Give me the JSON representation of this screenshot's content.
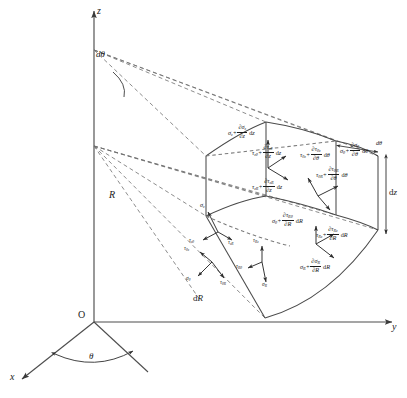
{
  "figure": {
    "background": "#ffffff",
    "line_color": "#4a4a4a",
    "text_color": "#1b1b1b"
  },
  "axes": {
    "z_label": "z",
    "y_label": "y",
    "x_label": "x",
    "origin_label": "O"
  },
  "geometry_labels": {
    "d_theta_top": "dθ",
    "theta_base": "θ",
    "radius": "R",
    "dR": "dR",
    "dz_right": "dz",
    "d_theta_right": "dθ"
  },
  "stresses": {
    "inner_top": [
      {
        "symbol": "σ",
        "sub": "z"
      },
      {
        "symbol": "τ",
        "sub": "zθ"
      },
      {
        "symbol": "τ",
        "sub": "zR"
      }
    ],
    "inner_side": [
      {
        "symbol": "τ",
        "sub": "θz"
      },
      {
        "symbol": "σ",
        "sub": "θ"
      },
      {
        "symbol": "τ",
        "sub": "θR"
      }
    ],
    "inner_radial": [
      {
        "symbol": "τ",
        "sub": "Rz"
      },
      {
        "symbol": "τ",
        "sub": "Rθ"
      },
      {
        "symbol": "σ",
        "sub": "R"
      }
    ]
  },
  "increments": {
    "top_face": [
      {
        "base": "σ",
        "base_sub": "z",
        "dnum": "∂σ",
        "dnum_sub": "z",
        "dden": "∂z",
        "diff": "dz"
      },
      {
        "base": "τ",
        "base_sub": "zθ",
        "dnum": "∂τ",
        "dnum_sub": "zθ",
        "dden": "∂z",
        "diff": "dz"
      },
      {
        "base": "τ",
        "base_sub": "zR",
        "dnum": "∂τ",
        "dnum_sub": "zR",
        "dden": "∂z",
        "diff": "dz"
      }
    ],
    "theta_face": [
      {
        "base": "τ",
        "base_sub": "θz",
        "dnum": "∂τ",
        "dnum_sub": "θz",
        "dden": "∂θ",
        "diff": "dθ"
      },
      {
        "base": "σ",
        "base_sub": "θ",
        "dnum": "∂σ",
        "dnum_sub": "θ",
        "dden": "∂θ",
        "diff": "dθ"
      },
      {
        "base": "τ",
        "base_sub": "θR",
        "dnum": "∂τ",
        "dnum_sub": "θR",
        "dden": "∂θ",
        "diff": "dθ"
      }
    ],
    "radial_face": [
      {
        "base": "τ",
        "base_sub": "Rz",
        "dnum": "∂τ",
        "dnum_sub": "Rz",
        "dden": "∂R",
        "diff": "dR"
      },
      {
        "base": "τ",
        "base_sub": "Rθ",
        "dnum": "∂τ",
        "dnum_sub": "Rθ",
        "dden": "∂R",
        "diff": "dR"
      },
      {
        "base": "σ",
        "base_sub": "R",
        "dnum": "∂σ",
        "dnum_sub": "R",
        "dden": "∂R",
        "diff": "dR"
      }
    ]
  },
  "plus": "+"
}
